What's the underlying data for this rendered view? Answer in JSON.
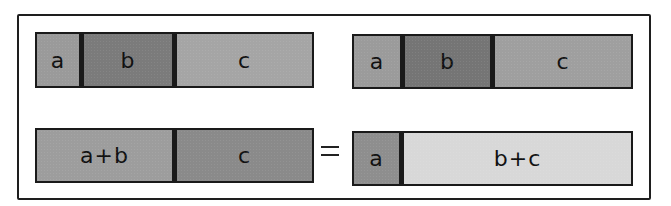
{
  "diagram": {
    "top_left": {
      "segments": [
        {
          "label": "a",
          "color": "#9a9a9a"
        },
        {
          "label": "b",
          "color": "#7b7b7b"
        },
        {
          "label": "c",
          "color": "#a5a5a5"
        }
      ]
    },
    "top_right": {
      "segments": [
        {
          "label": "a",
          "color": "#9b9b9b"
        },
        {
          "label": "b",
          "color": "#757575"
        },
        {
          "label": "c",
          "color": "#9f9f9f"
        }
      ]
    },
    "bottom_left": {
      "segments": [
        {
          "label": "a+b",
          "color": "#9d9d9d"
        },
        {
          "label": "c",
          "color": "#8a8a8a"
        }
      ]
    },
    "operator": "=",
    "bottom_right": {
      "segments": [
        {
          "label": "a",
          "color": "#8e8e8e"
        },
        {
          "label": "b+c",
          "color": "#d8d8d8"
        }
      ]
    }
  }
}
